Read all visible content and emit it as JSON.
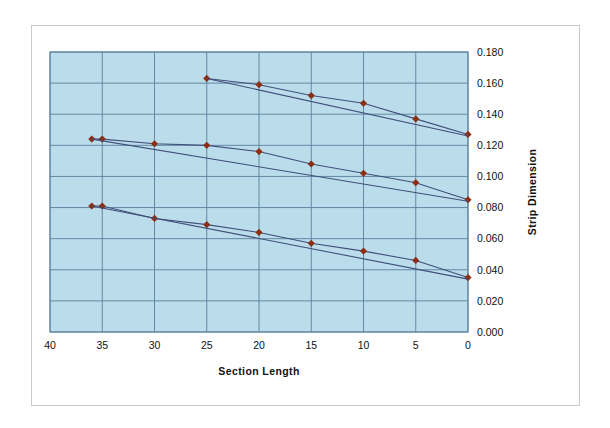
{
  "chart_data": {
    "type": "line",
    "title": "",
    "xlabel": "Section Length",
    "ylabel": "Strip Dimension",
    "xlim": [
      40,
      0
    ],
    "ylim": [
      0.0,
      0.18
    ],
    "x_reversed": true,
    "grid": true,
    "legend": "none",
    "plot_background": "#bbdcea",
    "gridline_color": "#5a7f9c",
    "marker_color": "#8c2f14",
    "line_color": "#3f4f7a",
    "xticks": [
      40,
      35,
      30,
      25,
      20,
      15,
      10,
      5,
      0
    ],
    "xtick_labels": [
      "40",
      "35",
      "30",
      "25",
      "20",
      "15",
      "10",
      "5",
      "0"
    ],
    "yticks": [
      0.0,
      0.02,
      0.04,
      0.06,
      0.08,
      0.1,
      0.12,
      0.14,
      0.16,
      0.18
    ],
    "ytick_labels": [
      "0.000",
      "0.020",
      "0.040",
      "0.060",
      "0.080",
      "0.100",
      "0.120",
      "0.140",
      "0.160",
      "0.180"
    ],
    "series": [
      {
        "name": "upper-measured",
        "marker": "diamond",
        "x": [
          25,
          20,
          15,
          10,
          5,
          0
        ],
        "values": [
          0.163,
          0.159,
          0.152,
          0.147,
          0.137,
          0.127
        ]
      },
      {
        "name": "upper-reference",
        "marker": "none",
        "x": [
          25,
          0
        ],
        "values": [
          0.163,
          0.126
        ]
      },
      {
        "name": "middle-measured",
        "marker": "diamond",
        "x": [
          36,
          35,
          30,
          25,
          20,
          15,
          10,
          5,
          0
        ],
        "values": [
          0.124,
          0.124,
          0.121,
          0.12,
          0.116,
          0.108,
          0.102,
          0.096,
          0.085
        ]
      },
      {
        "name": "middle-reference",
        "marker": "none",
        "x": [
          36,
          0
        ],
        "values": [
          0.124,
          0.084
        ]
      },
      {
        "name": "lower-measured",
        "marker": "diamond",
        "x": [
          36,
          35,
          30,
          25,
          20,
          15,
          10,
          5,
          0
        ],
        "values": [
          0.081,
          0.081,
          0.073,
          0.069,
          0.064,
          0.057,
          0.052,
          0.046,
          0.035
        ]
      },
      {
        "name": "lower-reference",
        "marker": "none",
        "x": [
          36,
          0
        ],
        "values": [
          0.081,
          0.034
        ]
      }
    ]
  }
}
